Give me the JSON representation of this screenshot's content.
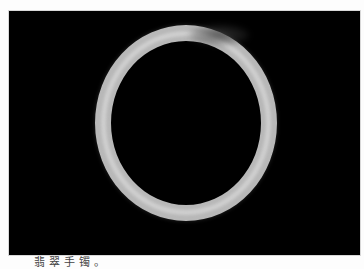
{
  "figure": {
    "image": {
      "subject": "jade bangle bracelet on black background",
      "background_color": "#000000",
      "ring_color": "#b8b8b8"
    },
    "caption": "翡翠手镯。"
  }
}
